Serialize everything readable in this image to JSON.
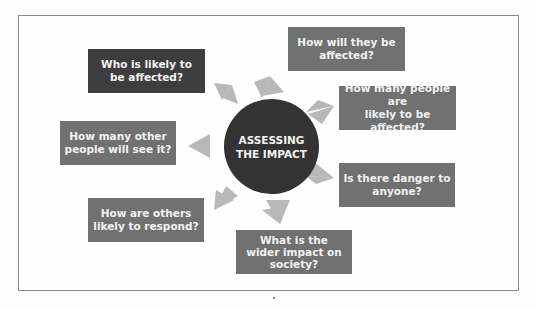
{
  "diagram": {
    "center": {
      "label": "ASSESSING\nTHE IMPACT"
    },
    "nodes": [
      {
        "id": "who-affected",
        "label": "Who is likely to\nbe affected?",
        "style": "dark"
      },
      {
        "id": "how-affected",
        "label": "How will they be\naffected?",
        "style": "mid"
      },
      {
        "id": "how-many-affected",
        "label": "How many people are\nlikely to be affected?",
        "style": "mid"
      },
      {
        "id": "how-many-see",
        "label": "How many other\npeople will see it?",
        "style": "mid"
      },
      {
        "id": "danger",
        "label": "Is there danger to\nanyone?",
        "style": "mid"
      },
      {
        "id": "others-respond",
        "label": "How are others\nlikely to respond?",
        "style": "mid"
      },
      {
        "id": "wider-impact",
        "label": "What is the\nwider impact on\nsociety?",
        "style": "mid"
      }
    ],
    "colors": {
      "center": "#333333",
      "dark_box": "#3d3d3d",
      "mid_box": "#717171",
      "arrow": "#b5b5b5",
      "text": "#f2f2f2"
    }
  }
}
